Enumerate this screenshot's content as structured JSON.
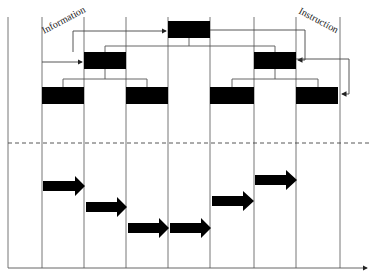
{
  "diagram": {
    "type": "hierarchical-flow",
    "labels": {
      "left": "Information",
      "right": "Instruction"
    },
    "colors": {
      "box": "#000000",
      "line": "#555555",
      "background": "#ffffff"
    },
    "columns_x": [
      8,
      42,
      84,
      126,
      168,
      210,
      254,
      296,
      340
    ],
    "levels": [
      {
        "name": "level-1",
        "boxes": [
          {
            "x1": 168,
            "x2": 210
          }
        ]
      },
      {
        "name": "level-2",
        "boxes": [
          {
            "x1": 84,
            "x2": 126
          },
          {
            "x1": 254,
            "x2": 296
          }
        ]
      },
      {
        "name": "level-3",
        "boxes": [
          {
            "x1": 42,
            "x2": 84
          },
          {
            "x1": 126,
            "x2": 168
          },
          {
            "x1": 210,
            "x2": 254
          },
          {
            "x1": 296,
            "x2": 340
          }
        ]
      }
    ],
    "flow_arrows": [
      {
        "x1": 42,
        "x2": 84,
        "y": 186
      },
      {
        "x1": 84,
        "x2": 126,
        "y": 207
      },
      {
        "x1": 126,
        "x2": 168,
        "y": 228
      },
      {
        "x1": 168,
        "x2": 210,
        "y": 228
      },
      {
        "x1": 210,
        "x2": 254,
        "y": 201
      },
      {
        "x1": 254,
        "x2": 296,
        "y": 180
      }
    ],
    "divider": {
      "style": "dashed",
      "y": 143
    },
    "time_axis": {
      "y": 268,
      "arrow": true
    }
  }
}
